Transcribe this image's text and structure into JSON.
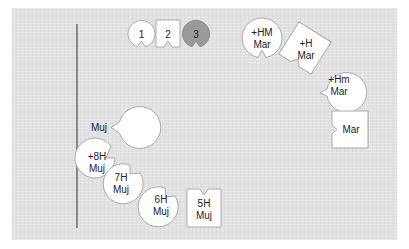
{
  "legend": [
    {
      "label": "1",
      "shape": "notched-circle",
      "fill": "#ffffff"
    },
    {
      "label": "2",
      "shape": "notched-square",
      "fill": "#ffffff"
    },
    {
      "label": "3",
      "shape": "notched-circle",
      "fill": "#9a9a9a"
    }
  ],
  "timeline_axis": {
    "label": ""
  },
  "nodes": [
    {
      "id": "muj",
      "lines": [
        "Muj"
      ],
      "shape": "notched-circle",
      "notch": "right"
    },
    {
      "id": "8h-muj",
      "lines": [
        "+8H",
        "Muj"
      ],
      "shape": "notched-circle",
      "notch": "upper-right"
    },
    {
      "id": "7h-muj",
      "lines": [
        "7H",
        "Muj"
      ],
      "shape": "notched-circle",
      "notch": "upper-right"
    },
    {
      "id": "6h-muj",
      "lines": [
        "6H",
        "Muj"
      ],
      "shape": "notched-circle",
      "notch": "top-right"
    },
    {
      "id": "5h-muj",
      "lines": [
        "5H",
        "Muj"
      ],
      "shape": "notched-square",
      "notch": "top"
    },
    {
      "id": "hm-mar",
      "lines": [
        "+HM",
        "Mar"
      ],
      "shape": "notched-circle",
      "notch": "bottom"
    },
    {
      "id": "h-mar",
      "lines": [
        "+H",
        "Mar"
      ],
      "shape": "notched-square-rotated",
      "notch": "bottom"
    },
    {
      "id": "hm2-mar",
      "lines": [
        "+Hm",
        "Mar"
      ],
      "shape": "notched-circle",
      "notch": "lower-left"
    },
    {
      "id": "mar",
      "lines": [
        "Mar"
      ],
      "shape": "notched-square",
      "notch": "left"
    }
  ],
  "colors": {
    "panel": "#e2e2e2",
    "stroke": "#9a9a9a",
    "shape_fill": "#ffffff",
    "dark_fill": "#9a9a9a",
    "axis": "#555555"
  }
}
